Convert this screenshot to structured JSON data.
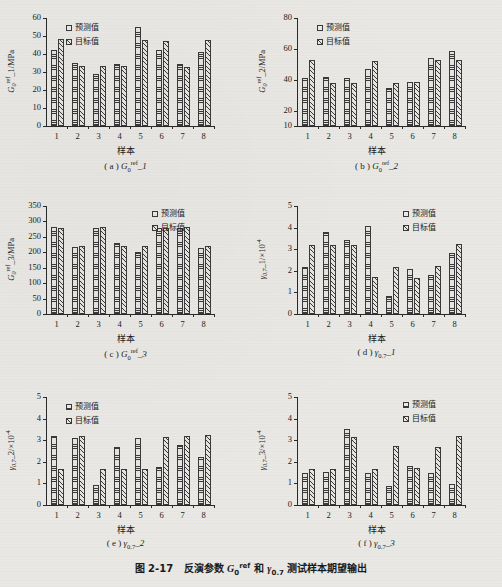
{
  "figure": {
    "caption_prefix": "图 2-17",
    "caption_text": "反演参数 G₀ʳᵉᶠ 和 γ₀.₇ 测试样本期望输出",
    "caption_full": "图 2-17　反演参数 G0ref 和 γ0.7 测试样本期望输出",
    "background_color": "#e9e8e4",
    "ink_color": "#2a2a2a"
  },
  "legend": {
    "predicted_label": "预测值",
    "target_label": "目标值"
  },
  "common": {
    "xlabel": "样本",
    "categories": [
      "1",
      "2",
      "3",
      "4",
      "5",
      "6",
      "7",
      "8"
    ]
  },
  "chart_data": [
    {
      "id": "a",
      "type": "bar",
      "caption": "(a) G0ref_1",
      "caption_letter": "( a )",
      "caption_symbol_base": "G",
      "caption_symbol_sub": "0",
      "caption_symbol_sup": "ref",
      "caption_symbol_tail": "_1",
      "title": "",
      "xlabel": "样本",
      "ylabel": "G0ref_1/MPa",
      "ylabel_base": "G",
      "ylabel_sub": "0",
      "ylabel_sup": "ref",
      "ylabel_tail": "_1/MPa",
      "categories": [
        "1",
        "2",
        "3",
        "4",
        "5",
        "6",
        "7",
        "8"
      ],
      "ylim": [
        0,
        60
      ],
      "yticks": [
        0,
        10,
        20,
        30,
        40,
        50,
        60
      ],
      "grid": false,
      "legend_position": "top-left",
      "series": [
        {
          "name": "预测值",
          "values": [
            42.2,
            35.2,
            28.8,
            34.6,
            55.1,
            42.2,
            34.2,
            41.0
          ]
        },
        {
          "name": "目标值",
          "values": [
            48.4,
            33.2,
            33.4,
            33.2,
            48.0,
            47.2,
            33.0,
            48.0
          ]
        }
      ]
    },
    {
      "id": "b",
      "type": "bar",
      "caption": "(b) G0ref_2",
      "caption_letter": "( b )",
      "caption_symbol_base": "G",
      "caption_symbol_sub": "0",
      "caption_symbol_sup": "ref",
      "caption_symbol_tail": "_2",
      "title": "",
      "xlabel": "样本",
      "ylabel": "G0ref_2/MPa",
      "ylabel_base": "G",
      "ylabel_sub": "0",
      "ylabel_sup": "ref",
      "ylabel_tail": "_2/MPa",
      "categories": [
        "1",
        "2",
        "3",
        "4",
        "5",
        "6",
        "7",
        "8"
      ],
      "ylim": [
        10,
        80
      ],
      "yticks": [
        10,
        20,
        40,
        60,
        80
      ],
      "grid": false,
      "legend_position": "top-left",
      "series": [
        {
          "name": "预测值",
          "values": [
            40.8,
            42.0,
            41.2,
            47.0,
            34.7,
            38.7,
            53.8,
            58.4
          ]
        },
        {
          "name": "目标值",
          "values": [
            53.0,
            37.8,
            38.0,
            52.3,
            38.0,
            38.4,
            52.5,
            52.5
          ]
        }
      ]
    },
    {
      "id": "c",
      "type": "bar",
      "caption": "(c) G0ref_3",
      "caption_letter": "( c )",
      "caption_symbol_base": "G",
      "caption_symbol_sub": "0",
      "caption_symbol_sup": "ref",
      "caption_symbol_tail": "_3",
      "title": "",
      "xlabel": "样本",
      "ylabel": "G0ref_3/MPa",
      "ylabel_base": "G",
      "ylabel_sub": "0",
      "ylabel_sup": "ref",
      "ylabel_tail": "_3/MPa",
      "categories": [
        "1",
        "2",
        "3",
        "4",
        "5",
        "6",
        "7",
        "8"
      ],
      "ylim": [
        0,
        350
      ],
      "yticks": [
        0,
        50,
        100,
        150,
        200,
        250,
        300,
        350
      ],
      "grid": false,
      "legend_position": "top-right",
      "series": [
        {
          "name": "预测值",
          "values": [
            282,
            218,
            278,
            230,
            202,
            279,
            279,
            213
          ]
        },
        {
          "name": "目标值",
          "values": [
            280,
            221,
            281,
            221,
            221,
            280,
            283,
            220
          ]
        }
      ]
    },
    {
      "id": "d",
      "type": "bar",
      "caption": "(d) γ0.7_1",
      "caption_letter": "( d )",
      "caption_symbol_base": "γ",
      "caption_symbol_sub": "0.7",
      "caption_symbol_sup": "",
      "caption_symbol_tail": "_1",
      "title": "",
      "xlabel": "样本",
      "ylabel": "γ0.7_1/×10-4",
      "ylabel_base": "γ",
      "ylabel_sub": "0.7",
      "ylabel_sup": "",
      "ylabel_tail": "_1/×10",
      "ylabel_exp": "-4",
      "categories": [
        "1",
        "2",
        "3",
        "4",
        "5",
        "6",
        "7",
        "8"
      ],
      "ylim": [
        0,
        5
      ],
      "yticks": [
        0,
        1,
        2,
        3,
        4,
        5
      ],
      "grid": false,
      "legend_position": "top-right",
      "series": [
        {
          "name": "预测值",
          "values": [
            2.16,
            3.8,
            3.44,
            4.06,
            0.82,
            2.08,
            1.82,
            2.84
          ]
        },
        {
          "name": "目标值",
          "values": [
            3.2,
            3.2,
            3.2,
            1.72,
            2.18,
            1.66,
            2.2,
            3.22
          ]
        }
      ]
    },
    {
      "id": "e",
      "type": "bar",
      "caption": "(e) γ0.7_2",
      "caption_letter": "( e )",
      "caption_symbol_base": "γ",
      "caption_symbol_sub": "0.7",
      "caption_symbol_sup": "",
      "caption_symbol_tail": "_2",
      "title": "",
      "xlabel": "样本",
      "ylabel": "γ0.7_2/×10-4",
      "ylabel_base": "γ",
      "ylabel_sub": "0.7",
      "ylabel_sup": "",
      "ylabel_tail": "_2/×10",
      "ylabel_exp": "-4",
      "categories": [
        "1",
        "2",
        "3",
        "4",
        "5",
        "6",
        "7",
        "8"
      ],
      "ylim": [
        0,
        5
      ],
      "yticks": [
        0,
        1,
        2,
        3,
        4,
        5
      ],
      "grid": false,
      "legend_position": "top-left",
      "series": [
        {
          "name": "预测值",
          "values": [
            3.18,
            3.08,
            0.92,
            2.7,
            3.08,
            1.74,
            2.8,
            2.2
          ]
        },
        {
          "name": "目标值",
          "values": [
            1.68,
            3.2,
            1.68,
            1.68,
            1.68,
            3.16,
            3.18,
            3.22
          ]
        }
      ]
    },
    {
      "id": "f",
      "type": "bar",
      "caption": "(f) γ0.7_3",
      "caption_letter": "( f )",
      "caption_symbol_base": "γ",
      "caption_symbol_sub": "0.7",
      "caption_symbol_sup": "",
      "caption_symbol_tail": "_3",
      "title": "",
      "xlabel": "样本",
      "ylabel": "γ0.7_3/×10-4",
      "ylabel_base": "γ",
      "ylabel_sub": "0.7",
      "ylabel_sup": "",
      "ylabel_tail": "_3/×10",
      "ylabel_exp": "-4",
      "categories": [
        "1",
        "2",
        "3",
        "4",
        "5",
        "6",
        "7",
        "8"
      ],
      "ylim": [
        0,
        5
      ],
      "yticks": [
        0,
        1,
        2,
        3,
        4,
        5
      ],
      "grid": false,
      "legend_position": "top-right",
      "series": [
        {
          "name": "预测值",
          "values": [
            1.46,
            1.52,
            3.52,
            1.46,
            0.9,
            1.8,
            1.5,
            0.98
          ]
        },
        {
          "name": "目标值",
          "values": [
            1.66,
            1.68,
            3.16,
            1.66,
            2.72,
            1.7,
            2.7,
            3.2
          ]
        }
      ]
    }
  ]
}
